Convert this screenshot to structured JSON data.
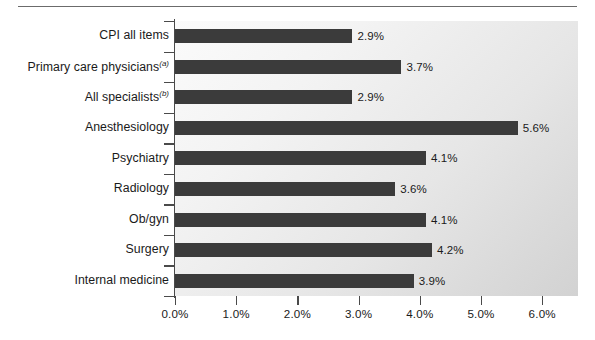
{
  "chart": {
    "type": "bar",
    "orientation": "horizontal",
    "background_color": "#eaeaea",
    "bar_color": "#3b3b3b",
    "axis_color": "#4a4a4a"
  },
  "chart_data": {
    "type": "bar",
    "title": "",
    "xlabel": "",
    "ylabel": "",
    "xlim": [
      0,
      6.5
    ],
    "xticks": [
      0,
      1,
      2,
      3,
      4,
      5,
      6
    ],
    "xtick_labels": [
      "0.0%",
      "1.0%",
      "2.0%",
      "3.0%",
      "4.0%",
      "5.0%",
      "6.0%"
    ],
    "grid": false,
    "legend": false,
    "categories": [
      "CPI all items",
      "Primary care physicians",
      "All specialists",
      "Anesthesiology",
      "Psychiatry",
      "Radiology",
      "Ob/gyn",
      "Surgery",
      "Internal medicine"
    ],
    "category_footnotes": [
      "",
      "(a)",
      "(b)",
      "",
      "",
      "",
      "",
      "",
      ""
    ],
    "values": [
      2.9,
      3.7,
      2.9,
      5.6,
      4.1,
      3.6,
      4.1,
      4.2,
      3.9
    ],
    "value_labels": [
      "2.9%",
      "3.7%",
      "2.9%",
      "5.6%",
      "4.1%",
      "3.6%",
      "4.1%",
      "4.2%",
      "3.9%"
    ]
  }
}
